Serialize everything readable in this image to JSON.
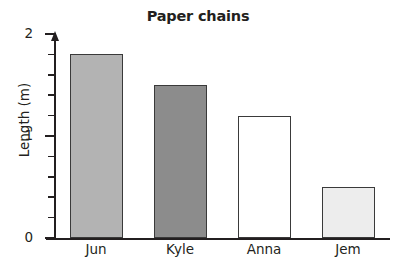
{
  "chart_data": {
    "type": "bar",
    "title": "Paper chains",
    "xlabel": "",
    "ylabel": "Length (m)",
    "categories": [
      "Jun",
      "Kyle",
      "Anna",
      "Jem"
    ],
    "values": [
      1.8,
      1.5,
      1.2,
      0.5
    ],
    "series": [
      {
        "name": "Length",
        "values": [
          1.8,
          1.5,
          1.2,
          0.5
        ]
      }
    ],
    "bar_colors": [
      "#b3b3b3",
      "#8c8c8c",
      "#ffffff",
      "#ededed"
    ],
    "bar_edge_color": "#3a3a3a",
    "ylim": [
      0,
      2
    ],
    "y_major_ticks": [
      0,
      1,
      2
    ],
    "y_major_tick_labels": [
      "0",
      "1",
      "2"
    ],
    "y_minor_tick_step": 0.2,
    "grid": false,
    "legend": null,
    "legend_position": "none",
    "axis_color": "#231f20",
    "background_color": "#ffffff",
    "y_axis_has_arrow": true
  },
  "axis": {
    "y_tick_0": "0",
    "y_tick_1": "1",
    "y_tick_2": "2"
  },
  "bars": [
    {
      "label": "Jun",
      "value": 1.8,
      "color": "#b3b3b3"
    },
    {
      "label": "Kyle",
      "value": 1.5,
      "color": "#8c8c8c"
    },
    {
      "label": "Anna",
      "value": 1.2,
      "color": "#ffffff"
    },
    {
      "label": "Jem",
      "value": 0.5,
      "color": "#ededed"
    }
  ]
}
